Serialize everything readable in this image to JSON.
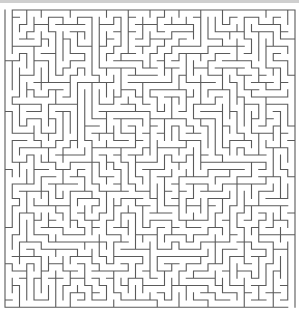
{
  "maze": {
    "cols": 40,
    "rows": 41,
    "cell_size": 7.25,
    "origin_x": 5,
    "origin_y": 10,
    "seed": 20240517,
    "wall_color": "#5a5a5a",
    "wall_width": 1.1,
    "background_color": "#ffffff",
    "entrance": {
      "side": "top",
      "col": 0
    },
    "exit": {
      "side": "bottom",
      "col": 39
    }
  },
  "top_bar": {
    "color": "#cfcfcf",
    "height": 3
  }
}
